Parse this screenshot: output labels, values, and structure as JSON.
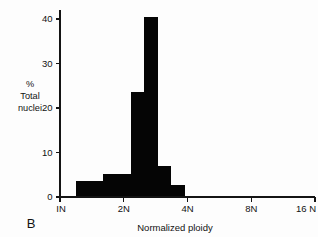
{
  "panel": {
    "label": "B"
  },
  "chart_data": {
    "type": "bar",
    "title": "",
    "subtitle": "",
    "xlabel": "Normalized ploidy",
    "ylabel": "% Total nuclei",
    "ylabel_lines": [
      "%",
      "Total",
      "nuclei"
    ],
    "grid": false,
    "legend": false,
    "legend_position": "none",
    "xscale": "log2",
    "xlim_ploidy": [
      1,
      16
    ],
    "xtick_labels": [
      "IN",
      "2N",
      "4N",
      "8N",
      "16 N"
    ],
    "xtick_ploidy": [
      1,
      2,
      4,
      8,
      16
    ],
    "ylim": [
      0,
      42
    ],
    "ytick_labels": [
      "0",
      "10",
      "20",
      "30",
      "40"
    ],
    "ytick_values": [
      0,
      10,
      20,
      30,
      40
    ],
    "bin_edges_ploidy": [
      1.19,
      1.38,
      1.6,
      1.86,
      2.16,
      2.5,
      2.9,
      3.36,
      3.9
    ],
    "categories": [
      "1.19-1.38",
      "1.38-1.60",
      "1.60-1.86",
      "1.86-2.16",
      "2.16-2.50",
      "2.50-2.90",
      "2.90-3.36",
      "3.36-3.90"
    ],
    "values": [
      3.5,
      3.5,
      5.2,
      5.2,
      23.5,
      40.5,
      7.0,
      2.7
    ],
    "bar_color": "#050505",
    "axis_color": "#141414"
  }
}
